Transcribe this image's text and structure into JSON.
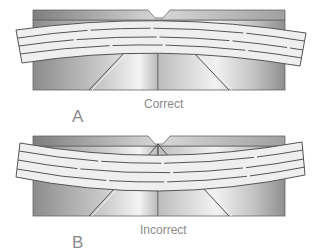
{
  "figures": [
    {
      "id": "A",
      "letter": "A",
      "caption": "Correct"
    },
    {
      "id": "B",
      "letter": "B",
      "caption": "Incorrect"
    }
  ],
  "colors": {
    "block_dark": "#8f8f8f",
    "block_light": "#f2f2f2",
    "board_fill": "#efefef",
    "outline": "#555555",
    "label": "#8a8a8a"
  }
}
